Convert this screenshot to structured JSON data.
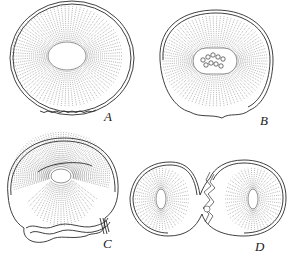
{
  "figure": {
    "panels": [
      {
        "id": "A",
        "label": "A",
        "stage": "single cell, large oval nucleus, radial striations",
        "cx": 72,
        "cy": 58,
        "rx": 60,
        "ry": 55,
        "nucleus": {
          "rx": 19,
          "ry": 14
        }
      },
      {
        "id": "B",
        "label": "B",
        "stage": "single cell, nucleus with chromosome cluster",
        "cx": 215,
        "cy": 62,
        "rx": 58,
        "ry": 51,
        "nucleus": {
          "rx": 21,
          "ry": 13
        },
        "chromosome_count": 9
      },
      {
        "id": "C",
        "label": "C",
        "stage": "cell with folded membrane at lower margin, small nucleus",
        "cx": 64,
        "cy": 190,
        "rx": 58,
        "ry": 52,
        "nucleus": {
          "rx": 10,
          "ry": 7
        }
      },
      {
        "id": "D",
        "label": "D",
        "stage": "two-cell division with cleavage furrow",
        "left_cx": 165,
        "right_cx": 255,
        "cy": 199,
        "nucleus": {
          "rx": 5,
          "ry": 10
        }
      }
    ],
    "colors": {
      "line": "#2a2a2a",
      "stipple": "#555555",
      "background": "#ffffff"
    }
  }
}
